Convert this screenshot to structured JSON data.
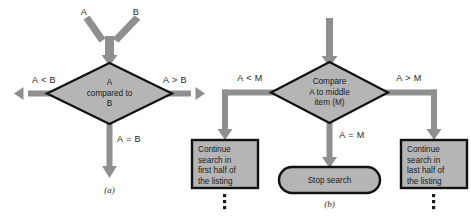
{
  "figure": {
    "colors": {
      "node_fill": "#b5b5b5",
      "node_stroke": "#111111",
      "arrow": "#8f8f8f",
      "background": "#ffffff",
      "text": "#1a1a1a"
    }
  },
  "panel_a": {
    "caption": "(a)",
    "inputs": [
      {
        "label": "A"
      },
      {
        "label": "B"
      }
    ],
    "decision": {
      "lines": [
        "A",
        "compared to",
        "B"
      ]
    },
    "branches": [
      {
        "label": "A < B",
        "direction": "left"
      },
      {
        "label": "A > B",
        "direction": "right"
      },
      {
        "label": "A = B",
        "direction": "down"
      }
    ]
  },
  "panel_b": {
    "caption": "(b)",
    "decision": {
      "lines": [
        "Compare",
        "A to middle",
        "item (M)"
      ]
    },
    "branches": [
      {
        "label": "A < M",
        "direction": "left"
      },
      {
        "label": "A = M",
        "direction": "down"
      },
      {
        "label": "A > M",
        "direction": "right"
      }
    ],
    "outcomes": [
      {
        "shape": "box",
        "lines": [
          "Continue",
          "search in",
          "first half of",
          "the listing"
        ],
        "continues": true
      },
      {
        "shape": "stadium",
        "lines": [
          "Stop search"
        ],
        "continues": false
      },
      {
        "shape": "box",
        "lines": [
          "Continue",
          "search in",
          "last half of",
          "the listing"
        ],
        "continues": true
      }
    ],
    "continuation_marker": "vertical-ellipsis"
  }
}
